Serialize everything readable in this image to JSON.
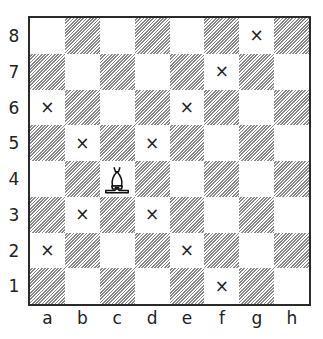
{
  "diagram": {
    "type": "chessboard",
    "files": [
      "a",
      "b",
      "c",
      "d",
      "e",
      "f",
      "g",
      "h"
    ],
    "ranks": [
      "8",
      "7",
      "6",
      "5",
      "4",
      "3",
      "2",
      "1"
    ],
    "piece": {
      "type": "bishop",
      "color": "white",
      "square": "c4",
      "symbol": "♗"
    },
    "mark_symbol": "×",
    "marked_squares": [
      "g8",
      "f7",
      "a6",
      "e6",
      "b5",
      "d5",
      "b3",
      "d3",
      "a2",
      "e2",
      "f1"
    ],
    "colors": {
      "dark_hatch": "#8a8a8a",
      "light": "#ffffff",
      "border": "#2a2a2a",
      "ink": "#222222"
    }
  }
}
